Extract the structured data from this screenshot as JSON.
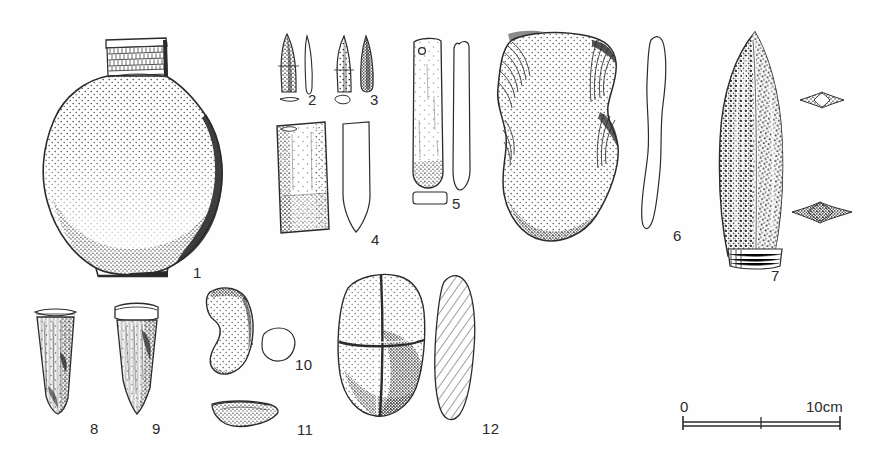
{
  "plate": {
    "kind": "archaeological-artifact-plate",
    "background_color": "#fefefe",
    "ink_color": "#2b2b2b",
    "width": 892,
    "height": 460
  },
  "scale_bar": {
    "left_label": "0",
    "right_label": "10cm",
    "divisions": 2,
    "x_start": 683,
    "x_end": 840,
    "y": 422
  },
  "figures": [
    {
      "number": "1",
      "name": "globular-jar",
      "description": "Large globular ceramic jar with short cylindrical neck, everted rim and banded comb-impressed neck decoration; stippled body shading",
      "label_x": 193,
      "label_y": 265
    },
    {
      "number": "2",
      "name": "bone-point-2",
      "description": "Small leaf-shaped bone point, front view with side profile and flat cross-section",
      "label_x": 308,
      "label_y": 92
    },
    {
      "number": "3",
      "name": "bone-point-3",
      "description": "Small elongated bone point, front view with side view and oval cross-section",
      "label_x": 370,
      "label_y": 92
    },
    {
      "number": "4",
      "name": "stone-adze-4",
      "description": "Rectangular stone adze blade, face view with pointed side profile",
      "label_x": 371,
      "label_y": 232
    },
    {
      "number": "5",
      "name": "perforated-pendant-5",
      "description": "Elongated perforated stone pendant with suspension hole, face view, edge profile and rectangular cross-section",
      "label_x": 452,
      "label_y": 196
    },
    {
      "number": "6",
      "name": "waisted-flaked-axe-6",
      "description": "Large waisted flaked stone axe or hoe with stippled surface and flake-scar hatching, shown with thin edge profile",
      "label_x": 673,
      "label_y": 228
    },
    {
      "number": "7",
      "name": "polished-adze-7",
      "description": "Large lenticular polished stone adze with dark mottled surface and pale ground bevel at base; two cross-sections at right",
      "label_x": 771,
      "label_y": 268
    },
    {
      "number": "8",
      "name": "bone-tube-point-8",
      "description": "Tapering bone point with collar band at the head, longitudinally striated surface",
      "label_x": 90,
      "label_y": 421
    },
    {
      "number": "9",
      "name": "bone-tube-point-9",
      "description": "Tapering bone point with rim collar, smoother surface and shaded right edge",
      "label_x": 152,
      "label_y": 421
    },
    {
      "number": "10",
      "name": "crescent-object-10",
      "description": "Kidney or crescent shaped stippled object with rounded cross-section",
      "label_x": 295,
      "label_y": 357
    },
    {
      "number": "11",
      "name": "curved-fragment-11",
      "description": "Thin curved shell or stone fragment, stippled",
      "label_x": 297,
      "label_y": 422
    },
    {
      "number": "12",
      "name": "split-pebble-12",
      "description": "Ovoid split pebble or nut shown in face view quartered by grooves, with obliquely hatched side profile",
      "label_x": 482,
      "label_y": 421
    }
  ]
}
